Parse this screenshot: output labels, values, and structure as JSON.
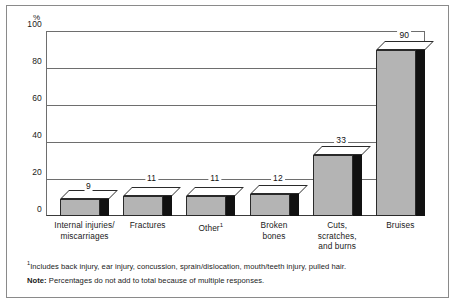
{
  "chart_data": {
    "type": "bar",
    "title": "",
    "subtitle": "",
    "xlabel": "",
    "ylabel": "%",
    "ylim": [
      0,
      100
    ],
    "yticks": [
      "0",
      "20",
      "40",
      "60",
      "80",
      "100"
    ],
    "grid": true,
    "legend": null,
    "categories": [
      "Internal injuries/\nmiscarriages",
      "Fractures",
      "Other",
      "Broken\nbones",
      "Cuts,\nscratches,\nand burns",
      "Bruises"
    ],
    "category_marks": [
      "",
      "",
      "1",
      "",
      "",
      ""
    ],
    "values": [
      9,
      11,
      11,
      12,
      33,
      90
    ],
    "value_labels": [
      "9",
      "11",
      "11",
      "12",
      "33",
      "90"
    ],
    "style": "3d-column",
    "colors": {
      "bar_front": "#b4b4b4",
      "bar_side": "#111111",
      "bar_top": "#ffffff",
      "gridline": "#6e6e6e",
      "frame": "#8a8a8a",
      "text": "#1a1a1a"
    }
  },
  "axis": {
    "percent_symbol": "%",
    "ticks": [
      {
        "label": "100",
        "value": 100
      },
      {
        "label": "80",
        "value": 80
      },
      {
        "label": "60",
        "value": 60
      },
      {
        "label": "40",
        "value": 40
      },
      {
        "label": "20",
        "value": 20
      },
      {
        "label": "0",
        "value": 0
      }
    ]
  },
  "footnotes": {
    "mark": "1",
    "footnote_text": "Includes back injury, ear injury, concussion, sprain/dislocation, mouth/teeth injury, pulled hair.",
    "note_label": "Note:",
    "note_text": "Percentages do not add to total because of multiple responses."
  }
}
